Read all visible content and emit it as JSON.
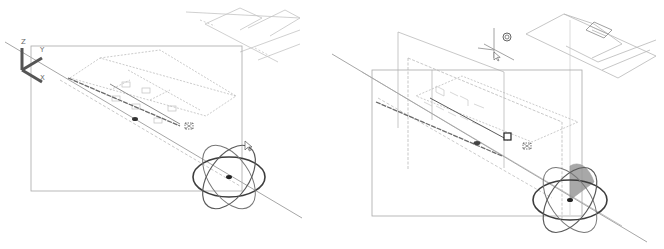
{
  "figure": {
    "panels": [
      {
        "id": "left",
        "description": "3D viewport with move/rotate gizmo on section line",
        "ucs_icon": {
          "axes": [
            "Z",
            "Y",
            "X"
          ]
        },
        "gizmo": "rotate-gizmo",
        "colors": {
          "line": "#9a9a9a",
          "dark": "#3c3c3c",
          "light": "#c8c8c8"
        }
      },
      {
        "id": "right",
        "description": "3D viewport with rotate gizmo showing highlighted quadrant and section planes",
        "gizmo": "rotate-gizmo-active",
        "colors": {
          "line": "#9a9a9a",
          "dark": "#3c3c3c",
          "highlight": "#8c8c8c"
        }
      }
    ]
  },
  "ucs": {
    "z": "Z",
    "y": "Y",
    "x": "X"
  }
}
